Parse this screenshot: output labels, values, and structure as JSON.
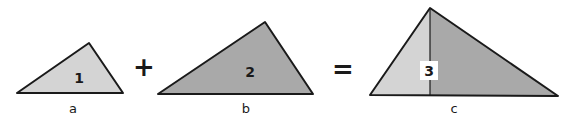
{
  "equation": {
    "operators": {
      "plus": "+",
      "equals": "="
    }
  },
  "triangles": [
    {
      "id": "1",
      "label": "1",
      "base_label": "a",
      "fill": "#d4d4d4"
    },
    {
      "id": "2",
      "label": "2",
      "base_label": "b",
      "fill": "#a9a9a9"
    },
    {
      "id": "3",
      "label": "3",
      "base_label": "c",
      "fill_left": "#d4d4d4",
      "fill_right": "#a9a9a9"
    }
  ],
  "colors": {
    "stroke": "#1a1a1a",
    "light": "#d4d4d4",
    "dark": "#a9a9a9",
    "label_box": "#ffffff"
  }
}
